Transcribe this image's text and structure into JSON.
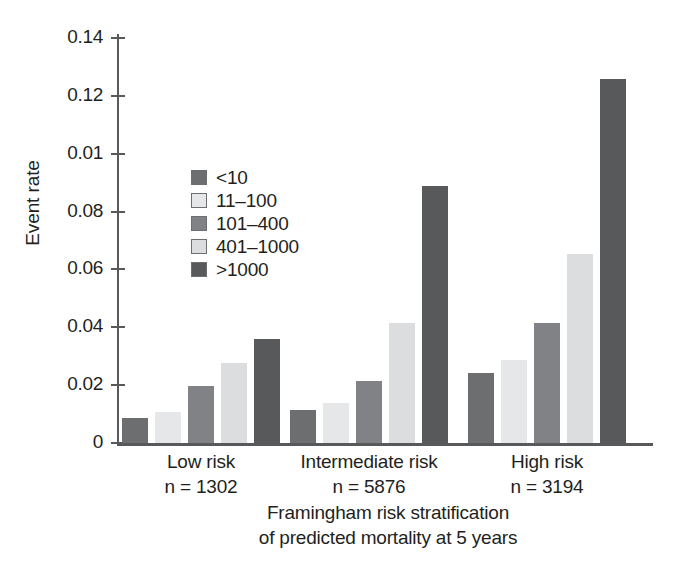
{
  "chart_data": {
    "type": "bar",
    "title": "",
    "xlabel": "Framingham risk stratification of predicted mortality at 5 years",
    "xlabel_lines": [
      "Framingham risk stratification",
      "of predicted mortality at 5 years"
    ],
    "ylabel": "Event rate",
    "ylim": [
      0,
      0.145
    ],
    "yticks": [
      0,
      0.02,
      0.04,
      0.06,
      0.08,
      0.01,
      0.12,
      0.14
    ],
    "ytick_labels": [
      "0",
      "0.02",
      "0.04",
      "0.06",
      "0.08",
      "0.01",
      "0.12",
      "0.14"
    ],
    "ytick_values": [
      0,
      0.02,
      0.04,
      0.06,
      0.08,
      0.1,
      0.12,
      0.14
    ],
    "grid": false,
    "legend_position": "inside upper-left",
    "legend_title": "",
    "categories": [
      "Low risk",
      "Intermediate risk",
      "High risk"
    ],
    "category_counts": [
      "n = 1302",
      "n = 5876",
      "n = 3194"
    ],
    "series": [
      {
        "name": "<10",
        "color": "#6d6e70",
        "values": [
          0.0086,
          0.0114,
          0.0243
        ]
      },
      {
        "name": "11–100",
        "color": "#e6e7e8",
        "values": [
          0.0107,
          0.0138,
          0.0286
        ]
      },
      {
        "name": "101–400",
        "color": "#808285",
        "values": [
          0.0197,
          0.0214,
          0.0414
        ]
      },
      {
        "name": "401–1000",
        "color": "#dcdddf",
        "values": [
          0.0276,
          0.0414,
          0.0655
        ]
      },
      {
        "name": ">1000",
        "color": "#58595b",
        "values": [
          0.0359,
          0.089,
          0.1259
        ]
      }
    ]
  },
  "axis": {
    "y_title": "Event rate",
    "x_title_line1": "Framingham risk stratification",
    "x_title_line2": "of predicted mortality at 5 years"
  },
  "groups": [
    {
      "label": "Low risk",
      "n": "n = 1302"
    },
    {
      "label": "Intermediate risk",
      "n": "n = 5876"
    },
    {
      "label": "High risk",
      "n": "n = 3194"
    }
  ],
  "legend": {
    "items": [
      {
        "label": "<10"
      },
      {
        "label": "11–100"
      },
      {
        "label": "101–400"
      },
      {
        "label": "401–1000"
      },
      {
        "label": ">1000"
      }
    ]
  },
  "colors": {
    "axis": "#58595b",
    "text": "#231f20",
    "background": "#ffffff"
  }
}
